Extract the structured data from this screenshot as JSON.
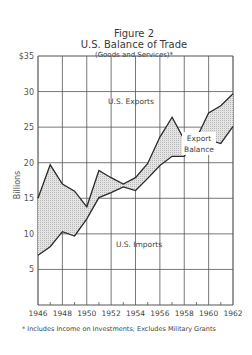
{
  "header": {
    "figure": "Figure 2",
    "title": "U.S. Balance of Trade",
    "subtitle": "(Goods and Services)*"
  },
  "footnote": "* Includes Income on Investments; Excludes Military Grants",
  "axis": {
    "ylabel": "Billions",
    "yticks": [
      "$35",
      "30",
      "25",
      "20",
      "15",
      "10",
      "5"
    ],
    "xticks": [
      "1946",
      "1948",
      "1950",
      "1952",
      "1954",
      "1956",
      "1958",
      "1960",
      "1962"
    ]
  },
  "annotations": {
    "exports": "U.S. Exports",
    "balance_line1": "Export",
    "balance_line2": "Balance",
    "imports": "U.S. Imports"
  },
  "chart_data": {
    "type": "area",
    "xlabel": "",
    "ylabel": "Billions",
    "ylim": [
      0,
      35
    ],
    "x": [
      1946,
      1947,
      1948,
      1949,
      1950,
      1951,
      1952,
      1953,
      1954,
      1955,
      1956,
      1957,
      1958,
      1959,
      1960,
      1961,
      1962
    ],
    "series": [
      {
        "name": "U.S. Exports",
        "values": [
          15.0,
          19.7,
          17.0,
          16.0,
          13.8,
          18.9,
          17.9,
          17.0,
          17.9,
          19.9,
          23.6,
          26.4,
          23.2,
          23.4,
          27.0,
          28.0,
          29.7
        ]
      },
      {
        "name": "U.S. Imports",
        "values": [
          7.0,
          8.2,
          10.3,
          9.7,
          12.1,
          15.1,
          15.8,
          16.6,
          16.1,
          17.8,
          19.6,
          20.9,
          20.9,
          23.6,
          23.2,
          22.7,
          25.1
        ]
      }
    ],
    "annotations": [
      "U.S. Exports",
      "Export Balance",
      "U.S. Imports"
    ],
    "footnote": "* Includes Income on Investments; Excludes Military Grants",
    "grid": true,
    "fill_between": "Export Balance (shaded)"
  }
}
